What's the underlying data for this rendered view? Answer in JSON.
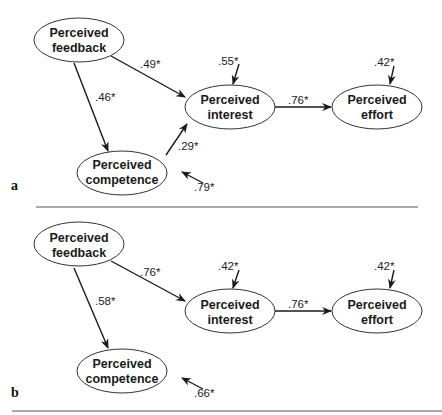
{
  "figure": {
    "panels": [
      {
        "label": "a",
        "nodes": {
          "feedback": {
            "line1": "Perceived",
            "line2": "feedback"
          },
          "interest": {
            "line1": "Perceived",
            "line2": "interest"
          },
          "effort": {
            "line1": "Perceived",
            "line2": "effort"
          },
          "competence": {
            "line1": "Perceived",
            "line2": "competence"
          }
        },
        "paths": {
          "feedback_to_interest": ".49*",
          "feedback_to_competence": ".46*",
          "competence_to_interest": ".29*",
          "interest_to_effort": ".76*"
        },
        "residuals": {
          "interest": ".55*",
          "effort": ".42*",
          "competence": ".79*"
        }
      },
      {
        "label": "b",
        "nodes": {
          "feedback": {
            "line1": "Perceived",
            "line2": "feedback"
          },
          "interest": {
            "line1": "Perceived",
            "line2": "interest"
          },
          "effort": {
            "line1": "Perceived",
            "line2": "effort"
          },
          "competence": {
            "line1": "Perceived",
            "line2": "competence"
          }
        },
        "paths": {
          "feedback_to_interest": ".76*",
          "feedback_to_competence": ".58*",
          "interest_to_effort": ".76*"
        },
        "residuals": {
          "interest": ".42*",
          "effort": ".42*",
          "competence": ".66*"
        }
      }
    ]
  }
}
